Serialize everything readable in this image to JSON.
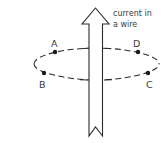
{
  "diagram": {
    "wire_label": {
      "line1": "current in",
      "line2": "a wire"
    },
    "points": [
      {
        "id": "A",
        "label": "A"
      },
      {
        "id": "B",
        "label": "B"
      },
      {
        "id": "C",
        "label": "C"
      },
      {
        "id": "D",
        "label": "D"
      }
    ],
    "colors": {
      "stroke": "#2a2a2a",
      "dot": "#1a1a1a",
      "text": "#3a3a3a",
      "background": "#ffffff"
    }
  }
}
